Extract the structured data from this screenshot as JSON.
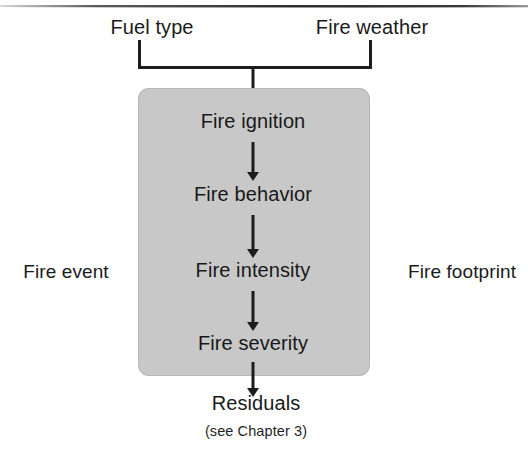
{
  "figure": {
    "inputs": [
      {
        "label": "Fuel type",
        "x": 152
      },
      {
        "label": "Fire weather",
        "x": 372
      }
    ],
    "side_labels": {
      "left": "Fire event",
      "right": "Fire footprint"
    },
    "steps": [
      {
        "label": "Fire ignition",
        "y": 110
      },
      {
        "label": "Fire behavior",
        "y": 183
      },
      {
        "label": "Fire intensity",
        "y": 259
      },
      {
        "label": "Fire severity",
        "y": 332
      }
    ],
    "output": {
      "label": "Residuals",
      "caption": "(see Chapter 3)"
    },
    "colors": {
      "box_fill": "#c8c8c8",
      "stroke": "#1c1c1c",
      "background": "#ffffff",
      "text": "#1a1a1a"
    }
  }
}
